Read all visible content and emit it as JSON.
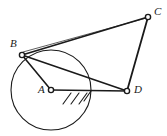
{
  "figure": {
    "kind": "geometry-diagram",
    "background_color": "#ffffff",
    "stroke_color": "#1a1a1a",
    "vertex_fill_color": "#ffffff",
    "canvas": {
      "width": 167,
      "height": 136
    },
    "points": [
      {
        "id": "A",
        "label": "A",
        "x": 51,
        "y": 90,
        "label_x": 38,
        "label_y": 84,
        "role": "circle-center"
      },
      {
        "id": "B",
        "label": "B",
        "x": 22,
        "y": 55,
        "label_x": 10,
        "label_y": 38,
        "role": "tangent-point"
      },
      {
        "id": "C",
        "label": "C",
        "x": 148,
        "y": 17,
        "label_x": 154,
        "label_y": 6,
        "role": "vertex"
      },
      {
        "id": "D",
        "label": "D",
        "x": 127,
        "y": 91,
        "label_x": 134,
        "label_y": 84,
        "role": "vertex"
      }
    ],
    "circle": {
      "center_id": "A",
      "cx": 51,
      "cy": 90,
      "r": 40
    },
    "segments": [
      {
        "id": "AB",
        "from": "B",
        "to": "A",
        "width": 1.6
      },
      {
        "id": "AD",
        "from": "A",
        "to": "D",
        "width": 1.6
      },
      {
        "id": "BD",
        "from": "B",
        "to": "D",
        "width": 1.6
      },
      {
        "id": "BC",
        "from": "B",
        "to": "C",
        "width": 1.8
      },
      {
        "id": "CD",
        "from": "C",
        "to": "D",
        "width": 1.8
      }
    ],
    "tangent_line": {
      "id": "B-tangent",
      "x1": 23,
      "y1": 52,
      "x2": 150,
      "y2": 17,
      "width": 0.7
    },
    "hatching": {
      "id": "ground-hatch",
      "count": 4,
      "marks": [
        {
          "x1": 63,
          "y1": 104,
          "x2": 71,
          "y2": 93
        },
        {
          "x1": 71,
          "y1": 104,
          "x2": 79,
          "y2": 93
        },
        {
          "x1": 79,
          "y1": 104,
          "x2": 87,
          "y2": 93
        },
        {
          "x1": 84,
          "y1": 101,
          "x2": 91,
          "y2": 91
        }
      ],
      "width": 1.1
    },
    "vertex_radius": 2.6,
    "vertex_stroke_width": 1.4
  }
}
